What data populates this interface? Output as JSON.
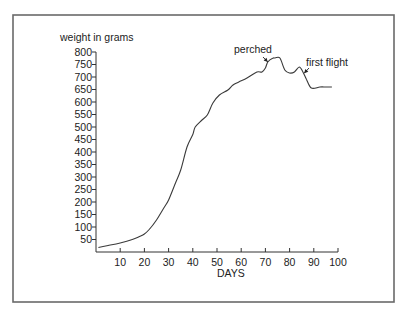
{
  "chart_data": {
    "type": "line",
    "title": "",
    "xlabel": "DAYS",
    "ylabel": "weight in grams",
    "xlim": [
      0,
      100
    ],
    "ylim": [
      0,
      800
    ],
    "grid": false,
    "x_ticks": [
      10,
      20,
      30,
      40,
      50,
      60,
      70,
      80,
      90,
      100
    ],
    "y_ticks": [
      50,
      100,
      150,
      200,
      250,
      300,
      350,
      400,
      450,
      500,
      550,
      600,
      650,
      700,
      750,
      800
    ],
    "series": [
      {
        "name": "weight",
        "x": [
          1,
          5,
          10,
          15,
          18,
          20,
          22,
          25,
          28,
          30,
          33,
          35,
          37.6,
          40,
          41,
          43.8,
          46,
          48.3,
          51,
          54.5,
          56.6,
          59,
          62.4,
          66.5,
          68.6,
          70,
          71,
          73,
          74,
          76,
          78,
          80,
          82,
          84,
          85.5,
          87,
          89,
          92.5,
          95,
          97.5
        ],
        "y": [
          18,
          26,
          36,
          50,
          62,
          72,
          90,
          128,
          176,
          208,
          280,
          328,
          420,
          470,
          500,
          528,
          548,
          596,
          628,
          648,
          668,
          680,
          696,
          720,
          720,
          736,
          760,
          775,
          776,
          776,
          728,
          716,
          720,
          740,
          720,
          690,
          656,
          660,
          660,
          660
        ]
      }
    ],
    "annotations": [
      {
        "text": "perched",
        "x": 71,
        "y": 760
      },
      {
        "text": "first flight",
        "x": 86,
        "y": 715
      }
    ]
  }
}
